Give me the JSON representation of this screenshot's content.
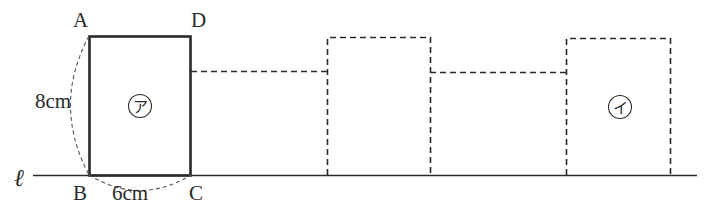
{
  "diagram": {
    "line_label": "ℓ",
    "vertices": {
      "A": "A",
      "B": "B",
      "C": "C",
      "D": "D"
    },
    "height_label": "8cm",
    "width_label": "6cm",
    "shape_a_label": "ア",
    "shape_b_label": "イ",
    "colors": {
      "stroke": "#2a2a2a",
      "background": "#ffffff"
    }
  }
}
